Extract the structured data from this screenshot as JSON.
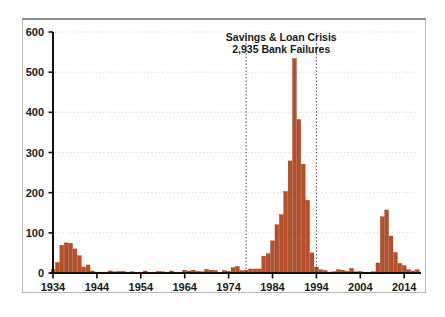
{
  "chart_data": {
    "type": "bar",
    "title": "",
    "subtitle": "",
    "xlabel": "",
    "ylabel": "",
    "ylim": [
      0,
      600
    ],
    "xlim": [
      1933,
      2018
    ],
    "grid": true,
    "legend_position": "none",
    "y_ticks": [
      0,
      100,
      200,
      300,
      400,
      500,
      600
    ],
    "y_tick_labels": [
      "0",
      "100",
      "200",
      "300",
      "400",
      "500",
      "600"
    ],
    "x_ticks": [
      1934,
      1944,
      1954,
      1964,
      1974,
      1984,
      1994,
      2004,
      2014
    ],
    "x_tick_labels": [
      "1934",
      "1944",
      "1954",
      "1964",
      "1974",
      "1984",
      "1994",
      "2004",
      "2014"
    ],
    "series_name": "Bank Failures",
    "bar_color": "#b94e27",
    "bar_edge_color": "#7d3217",
    "categories": [
      1934,
      1935,
      1936,
      1937,
      1938,
      1939,
      1940,
      1941,
      1942,
      1943,
      1944,
      1945,
      1946,
      1947,
      1948,
      1949,
      1950,
      1951,
      1952,
      1953,
      1954,
      1955,
      1956,
      1957,
      1958,
      1959,
      1960,
      1961,
      1962,
      1963,
      1964,
      1965,
      1966,
      1967,
      1968,
      1969,
      1970,
      1971,
      1972,
      1973,
      1974,
      1975,
      1976,
      1977,
      1978,
      1979,
      1980,
      1981,
      1982,
      1983,
      1984,
      1985,
      1986,
      1987,
      1988,
      1989,
      1990,
      1991,
      1992,
      1993,
      1994,
      1995,
      1996,
      1997,
      1998,
      1999,
      2000,
      2001,
      2002,
      2003,
      2004,
      2005,
      2006,
      2007,
      2008,
      2009,
      2010,
      2011,
      2012,
      2013,
      2014,
      2015,
      2016,
      2017
    ],
    "values": [
      9,
      26,
      69,
      75,
      74,
      60,
      43,
      15,
      20,
      5,
      2,
      1,
      1,
      5,
      3,
      4,
      4,
      2,
      3,
      2,
      2,
      5,
      2,
      1,
      4,
      3,
      1,
      5,
      1,
      2,
      7,
      5,
      7,
      4,
      3,
      9,
      7,
      6,
      1,
      6,
      4,
      13,
      16,
      6,
      7,
      10,
      10,
      10,
      42,
      48,
      80,
      120,
      145,
      203,
      279,
      534,
      382,
      271,
      181,
      50,
      15,
      8,
      6,
      1,
      3,
      8,
      7,
      4,
      11,
      3,
      4,
      0,
      0,
      3,
      25,
      140,
      157,
      92,
      51,
      24,
      18,
      8,
      5,
      8
    ],
    "annotations": [
      {
        "name": "savings-loan-crisis",
        "line1": "Savings & Loan Crisis",
        "line2": "2,935 Bank Failures",
        "span_start": 1978,
        "span_end": 1994
      }
    ]
  }
}
